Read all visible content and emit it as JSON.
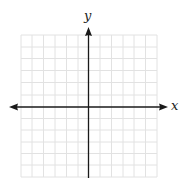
{
  "diagram": {
    "type": "coordinate-plane",
    "x_axis_label": "x",
    "y_axis_label": "y",
    "grid": {
      "columns": 12,
      "rows": 12,
      "line_color": "#e3e3e3",
      "axis_color": "#1a1a1a"
    }
  }
}
